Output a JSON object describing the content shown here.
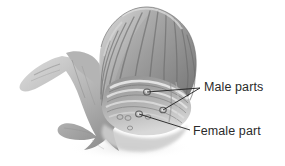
{
  "figure": {
    "background_color": "#ffffff",
    "width": 285,
    "height": 166,
    "style": "grayscale pencil and wash scientific illustration"
  },
  "subject": {
    "name": "mollusc",
    "description": "ribbed fan-shaped shell with soft body, extended foot and finger-like tentacles",
    "shell": {
      "name": "ribbed shell",
      "rib_count": 11,
      "tone_light": "#d9d9d9",
      "tone_mid": "#9a9a9a",
      "tone_dark": "#5e5e5e"
    },
    "body": {
      "name": "soft body and foot",
      "tone_light": "#cfcfcf",
      "tone_mid": "#a2a2a2",
      "tone_dark": "#6d6d6d"
    }
  },
  "callouts": [
    {
      "id": "male",
      "label": "Male parts",
      "color": "#2b2b2b",
      "leader_count": 2,
      "anchor": {
        "x": 200,
        "y": 88
      },
      "targets": [
        {
          "x": 147,
          "y": 92
        },
        {
          "x": 163,
          "y": 110
        }
      ]
    },
    {
      "id": "female",
      "label": "Female part",
      "color": "#2b2b2b",
      "leader_count": 1,
      "anchor": {
        "x": 190,
        "y": 130
      },
      "targets": [
        {
          "x": 139,
          "y": 114
        }
      ]
    }
  ],
  "organs": [
    {
      "name": "male-organ-upper",
      "x": 147,
      "y": 92
    },
    {
      "name": "male-organ-lower",
      "x": 163,
      "y": 110
    },
    {
      "name": "female-organ",
      "x": 139,
      "y": 114
    }
  ]
}
